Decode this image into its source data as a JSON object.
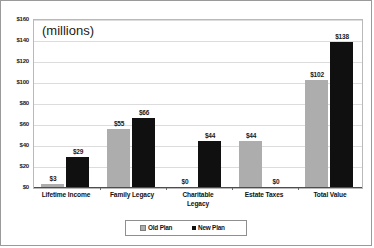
{
  "chart_data": {
    "type": "bar",
    "title": "(millions)",
    "subtitle": "",
    "xlabel": "",
    "ylabel": "",
    "ylim": [
      0,
      160
    ],
    "ytick_step": 20,
    "grid": true,
    "legend_position": "bottom",
    "categories": [
      "Lifetime Income",
      "Family Legacy",
      "Charitable Legacy",
      "Estate Taxes",
      "Total Value"
    ],
    "category_lines": [
      [
        "Lifetime Income"
      ],
      [
        "Family Legacy"
      ],
      [
        "Charitable",
        "Legacy"
      ],
      [
        "Estate Taxes"
      ],
      [
        "Total Value"
      ]
    ],
    "ytick_labels": [
      "$160",
      "$140",
      "$120",
      "$100",
      "$80",
      "$60",
      "$40",
      "$20",
      "$0"
    ],
    "ytick_values": [
      160,
      140,
      120,
      100,
      80,
      60,
      40,
      20,
      0
    ],
    "series": [
      {
        "name": "Old Plan",
        "color": "#adadad",
        "values": [
          3,
          55,
          0,
          44,
          102
        ],
        "labels": [
          "$3",
          "$55",
          "$0",
          "$44",
          "$102"
        ]
      },
      {
        "name": "New Plan",
        "color": "#101010",
        "values": [
          29,
          66,
          44,
          0,
          138
        ],
        "labels": [
          "$29",
          "$66",
          "$44",
          "$0",
          "$138"
        ]
      }
    ]
  },
  "legend": {
    "items": [
      {
        "label": "Old Plan",
        "marker": "square-swatch-gray"
      },
      {
        "label": "New Plan",
        "marker": "square-swatch-black"
      }
    ]
  }
}
